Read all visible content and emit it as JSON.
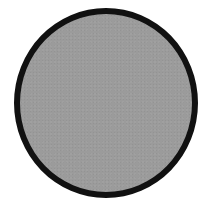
{
  "shape": {
    "type": "circle",
    "fill_color": "#9b9b9b",
    "border_color": "#111111",
    "border_width_px": 6
  },
  "background_color": "#ffffff"
}
